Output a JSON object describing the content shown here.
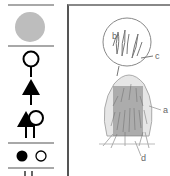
{
  "legend": {
    "items": [
      {
        "id": "grey-circle",
        "icon": "filled-grey-circle-icon",
        "color": "#bdbdbd"
      },
      {
        "id": "tree-symbol",
        "icon": "open-circle-on-stem-icon"
      },
      {
        "id": "conifer-symbol",
        "icon": "filled-triangle-on-stem-icon"
      },
      {
        "id": "mixed-symbol",
        "icon": "triangle-and-circle-on-stems-icon"
      },
      {
        "id": "dot-pair",
        "icon": "filled-and-open-dot-icon"
      },
      {
        "id": "stems-partial",
        "icon": "double-stem-icon"
      }
    ],
    "rule_color": "#a8a8a8"
  },
  "illustration": {
    "subject": "grass tussock with magnified inset",
    "labels": {
      "a": "a",
      "b": "b",
      "c": "c",
      "d": "d"
    }
  }
}
